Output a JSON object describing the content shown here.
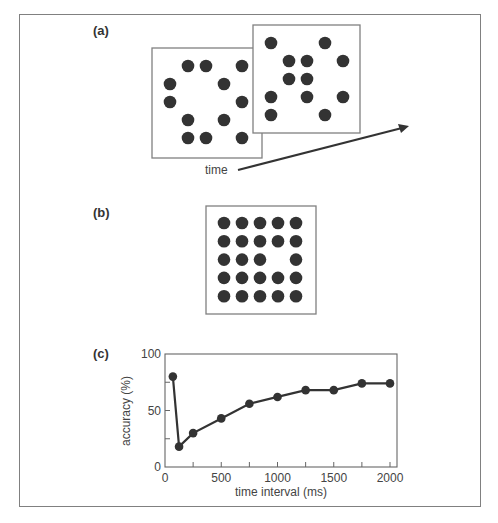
{
  "figure": {
    "panels": [
      {
        "id": "a",
        "label": "(a)",
        "description": "Two dot frames shown sequentially over time",
        "arrow_label": "time",
        "frames": [
          {
            "name": "frame-1",
            "box": [
              152,
              48,
              110,
              110
            ],
            "dots": [
              [
                188,
                66
              ],
              [
                206,
                66
              ],
              [
                242,
                66
              ],
              [
                170,
                84
              ],
              [
                224,
                84
              ],
              [
                170,
                102
              ],
              [
                242,
                102
              ],
              [
                188,
                120
              ],
              [
                224,
                120
              ],
              [
                188,
                138
              ],
              [
                206,
                138
              ],
              [
                242,
                138
              ]
            ]
          },
          {
            "name": "frame-2",
            "box": [
              253,
              25,
              107,
              108
            ],
            "dots": [
              [
                271,
                43
              ],
              [
                325,
                43
              ],
              [
                289,
                61
              ],
              [
                307,
                61
              ],
              [
                343,
                61
              ],
              [
                289,
                79
              ],
              [
                307,
                79
              ],
              [
                271,
                97
              ],
              [
                307,
                97
              ],
              [
                343,
                97
              ],
              [
                271,
                115
              ],
              [
                325,
                115
              ]
            ]
          }
        ]
      },
      {
        "id": "b",
        "label": "(b)",
        "description": "Superimposed 5x5 dot grid with one missing dot",
        "frame": {
          "box": [
            206,
            206,
            110,
            108
          ],
          "rows": 5,
          "cols": 5,
          "origin": [
            224,
            223
          ],
          "spacing": [
            18,
            18.3
          ],
          "missing": [
            [
              2,
              3
            ]
          ]
        }
      },
      {
        "id": "c",
        "label": "(c)",
        "description": "Accuracy vs. time interval"
      }
    ]
  },
  "chart_data": {
    "type": "line",
    "title": "",
    "xlabel": "time interval (ms)",
    "ylabel": "accuracy (%)",
    "x": [
      70,
      125,
      250,
      500,
      750,
      1000,
      1250,
      1500,
      1750,
      2000
    ],
    "values": [
      80,
      18,
      30,
      43,
      56,
      62,
      68,
      68,
      74,
      74
    ],
    "xlim": [
      0,
      2060
    ],
    "ylim": [
      0,
      100
    ],
    "xticks": [
      0,
      500,
      1000,
      1500,
      2000
    ],
    "xticks_minor": [
      250,
      750,
      1250,
      1750
    ],
    "yticks": [
      0,
      50,
      100
    ],
    "yticks_minor": [
      25,
      75
    ],
    "grid": false,
    "legend": null,
    "markers": true
  },
  "colors": {
    "ink": "#333333",
    "frame": "#808080",
    "dot": "#333333"
  }
}
